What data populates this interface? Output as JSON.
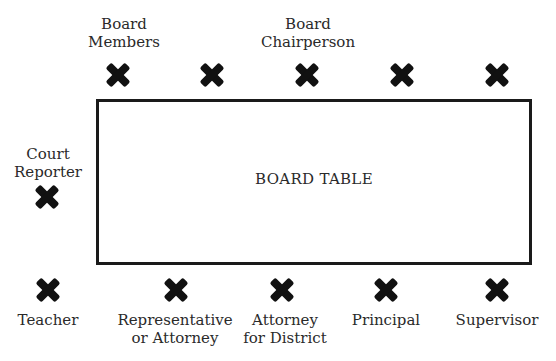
{
  "diagram": {
    "table_label": "BOARD TABLE",
    "top_labels": {
      "board_members": [
        "Board",
        "Members"
      ],
      "board_chairperson": [
        "Board",
        "Chairperson"
      ]
    },
    "left_label": [
      "Court",
      "Reporter"
    ],
    "bottom_labels": [
      {
        "lines": [
          "Teacher"
        ]
      },
      {
        "lines": [
          "Representative",
          "or Attorney"
        ]
      },
      {
        "lines": [
          "Attorney",
          "for District"
        ]
      },
      {
        "lines": [
          "Principal"
        ]
      },
      {
        "lines": [
          "Supervisor"
        ]
      }
    ],
    "seat_marker": "x-mark",
    "seat_counts": {
      "top": 5,
      "left": 1,
      "bottom": 5
    }
  }
}
